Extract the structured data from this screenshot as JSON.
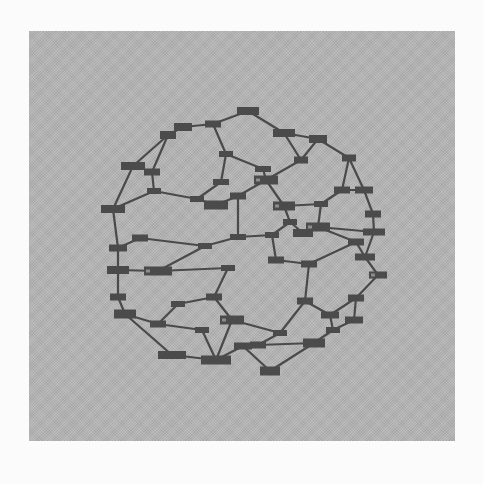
{
  "figure": {
    "panel_color": "#b4b4b4",
    "page_color": "#fbfbfb",
    "bond_color": "#4a4a4a",
    "atom_color": "#4b4b4b"
  },
  "atoms": [
    {
      "x": 248,
      "y": 111,
      "w": 22,
      "h": 8
    },
    {
      "x": 213,
      "y": 124,
      "w": 16,
      "h": 7
    },
    {
      "x": 183,
      "y": 127,
      "w": 18,
      "h": 8
    },
    {
      "x": 168,
      "y": 135,
      "w": 16,
      "h": 8
    },
    {
      "x": 284,
      "y": 133,
      "w": 22,
      "h": 8
    },
    {
      "x": 318,
      "y": 139,
      "w": 18,
      "h": 8
    },
    {
      "x": 349,
      "y": 158,
      "w": 14,
      "h": 7
    },
    {
      "x": 226,
      "y": 154,
      "w": 14,
      "h": 6
    },
    {
      "x": 263,
      "y": 169,
      "w": 16,
      "h": 6
    },
    {
      "x": 266,
      "y": 180,
      "w": 24,
      "h": 9
    },
    {
      "x": 301,
      "y": 160,
      "w": 14,
      "h": 7
    },
    {
      "x": 342,
      "y": 190,
      "w": 16,
      "h": 7
    },
    {
      "x": 364,
      "y": 190,
      "w": 18,
      "h": 7
    },
    {
      "x": 152,
      "y": 172,
      "w": 16,
      "h": 7
    },
    {
      "x": 113,
      "y": 209,
      "w": 24,
      "h": 8
    },
    {
      "x": 133,
      "y": 166,
      "w": 24,
      "h": 8
    },
    {
      "x": 154,
      "y": 191,
      "w": 14,
      "h": 6
    },
    {
      "x": 197,
      "y": 199,
      "w": 14,
      "h": 6
    },
    {
      "x": 216,
      "y": 205,
      "w": 24,
      "h": 9
    },
    {
      "x": 238,
      "y": 196,
      "w": 16,
      "h": 7
    },
    {
      "x": 221,
      "y": 182,
      "w": 16,
      "h": 6
    },
    {
      "x": 284,
      "y": 206,
      "w": 22,
      "h": 9
    },
    {
      "x": 321,
      "y": 204,
      "w": 14,
      "h": 6
    },
    {
      "x": 303,
      "y": 233,
      "w": 20,
      "h": 8
    },
    {
      "x": 373,
      "y": 214,
      "w": 16,
      "h": 7
    },
    {
      "x": 374,
      "y": 232,
      "w": 22,
      "h": 7
    },
    {
      "x": 140,
      "y": 238,
      "w": 16,
      "h": 7
    },
    {
      "x": 118,
      "y": 248,
      "w": 18,
      "h": 7
    },
    {
      "x": 118,
      "y": 270,
      "w": 22,
      "h": 8
    },
    {
      "x": 158,
      "y": 271,
      "w": 28,
      "h": 9
    },
    {
      "x": 205,
      "y": 246,
      "w": 14,
      "h": 6
    },
    {
      "x": 238,
      "y": 237,
      "w": 16,
      "h": 6
    },
    {
      "x": 272,
      "y": 235,
      "w": 14,
      "h": 6
    },
    {
      "x": 290,
      "y": 222,
      "w": 14,
      "h": 6
    },
    {
      "x": 276,
      "y": 260,
      "w": 16,
      "h": 7
    },
    {
      "x": 318,
      "y": 227,
      "w": 24,
      "h": 9
    },
    {
      "x": 356,
      "y": 242,
      "w": 16,
      "h": 7
    },
    {
      "x": 365,
      "y": 257,
      "w": 20,
      "h": 7
    },
    {
      "x": 309,
      "y": 264,
      "w": 16,
      "h": 7
    },
    {
      "x": 118,
      "y": 297,
      "w": 16,
      "h": 7
    },
    {
      "x": 125,
      "y": 314,
      "w": 22,
      "h": 9
    },
    {
      "x": 158,
      "y": 324,
      "w": 16,
      "h": 7
    },
    {
      "x": 178,
      "y": 304,
      "w": 14,
      "h": 6
    },
    {
      "x": 214,
      "y": 297,
      "w": 16,
      "h": 7
    },
    {
      "x": 228,
      "y": 268,
      "w": 14,
      "h": 6
    },
    {
      "x": 232,
      "y": 320,
      "w": 24,
      "h": 9
    },
    {
      "x": 305,
      "y": 301,
      "w": 16,
      "h": 7
    },
    {
      "x": 330,
      "y": 315,
      "w": 18,
      "h": 7
    },
    {
      "x": 356,
      "y": 298,
      "w": 16,
      "h": 7
    },
    {
      "x": 378,
      "y": 275,
      "w": 18,
      "h": 7
    },
    {
      "x": 280,
      "y": 333,
      "w": 14,
      "h": 6
    },
    {
      "x": 258,
      "y": 345,
      "w": 16,
      "h": 7
    },
    {
      "x": 314,
      "y": 343,
      "w": 22,
      "h": 9
    },
    {
      "x": 172,
      "y": 355,
      "w": 28,
      "h": 8
    },
    {
      "x": 216,
      "y": 360,
      "w": 30,
      "h": 9
    },
    {
      "x": 270,
      "y": 371,
      "w": 20,
      "h": 9
    },
    {
      "x": 243,
      "y": 346,
      "w": 18,
      "h": 7
    },
    {
      "x": 333,
      "y": 330,
      "w": 14,
      "h": 6
    },
    {
      "x": 354,
      "y": 320,
      "w": 18,
      "h": 7
    },
    {
      "x": 202,
      "y": 330,
      "w": 14,
      "h": 6
    }
  ],
  "bonds": [
    [
      0,
      1
    ],
    [
      0,
      4
    ],
    [
      1,
      2
    ],
    [
      2,
      3
    ],
    [
      1,
      7
    ],
    [
      4,
      5
    ],
    [
      5,
      6
    ],
    [
      4,
      10
    ],
    [
      7,
      8
    ],
    [
      8,
      9
    ],
    [
      9,
      10
    ],
    [
      10,
      5
    ],
    [
      3,
      13
    ],
    [
      3,
      15
    ],
    [
      15,
      14
    ],
    [
      13,
      16
    ],
    [
      16,
      17
    ],
    [
      7,
      20
    ],
    [
      20,
      17
    ],
    [
      17,
      18
    ],
    [
      18,
      19
    ],
    [
      19,
      9
    ],
    [
      9,
      21
    ],
    [
      21,
      22
    ],
    [
      22,
      11
    ],
    [
      11,
      6
    ],
    [
      11,
      12
    ],
    [
      6,
      12
    ],
    [
      12,
      24
    ],
    [
      24,
      25
    ],
    [
      25,
      35
    ],
    [
      35,
      22
    ],
    [
      14,
      27
    ],
    [
      14,
      16
    ],
    [
      27,
      26
    ],
    [
      26,
      30
    ],
    [
      27,
      28
    ],
    [
      28,
      29
    ],
    [
      29,
      30
    ],
    [
      30,
      31
    ],
    [
      31,
      19
    ],
    [
      31,
      32
    ],
    [
      32,
      33
    ],
    [
      33,
      21
    ],
    [
      32,
      34
    ],
    [
      35,
      36
    ],
    [
      36,
      37
    ],
    [
      25,
      37
    ],
    [
      34,
      38
    ],
    [
      38,
      36
    ],
    [
      37,
      49
    ],
    [
      35,
      23
    ],
    [
      23,
      33
    ],
    [
      28,
      39
    ],
    [
      39,
      40
    ],
    [
      40,
      41
    ],
    [
      41,
      42
    ],
    [
      42,
      43
    ],
    [
      43,
      44
    ],
    [
      44,
      29
    ],
    [
      43,
      45
    ],
    [
      45,
      50
    ],
    [
      50,
      46
    ],
    [
      46,
      38
    ],
    [
      46,
      47
    ],
    [
      47,
      48
    ],
    [
      48,
      49
    ],
    [
      48,
      58
    ],
    [
      58,
      57
    ],
    [
      57,
      52
    ],
    [
      47,
      57
    ],
    [
      40,
      53
    ],
    [
      53,
      54
    ],
    [
      54,
      45
    ],
    [
      54,
      56
    ],
    [
      56,
      51
    ],
    [
      51,
      50
    ],
    [
      52,
      55
    ],
    [
      55,
      56
    ],
    [
      41,
      59
    ],
    [
      59,
      54
    ],
    [
      52,
      51
    ]
  ],
  "highlighted_atoms": [
    9,
    21,
    35,
    49,
    29,
    45
  ]
}
